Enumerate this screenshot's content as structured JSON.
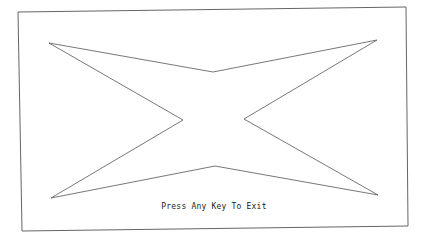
{
  "screen": {
    "message": "Press Any Key To Exit",
    "colors": {
      "background": "#ffffff",
      "line": "#555555"
    },
    "frame": [
      [
        18,
        12
      ],
      [
        406,
        7
      ],
      [
        408,
        226
      ],
      [
        22,
        231
      ]
    ],
    "star": [
      [
        49,
        43
      ],
      [
        213,
        72
      ],
      [
        377,
        40
      ],
      [
        244,
        119
      ],
      [
        378,
        195
      ],
      [
        215,
        166
      ],
      [
        51,
        198
      ],
      [
        183,
        120
      ]
    ]
  }
}
